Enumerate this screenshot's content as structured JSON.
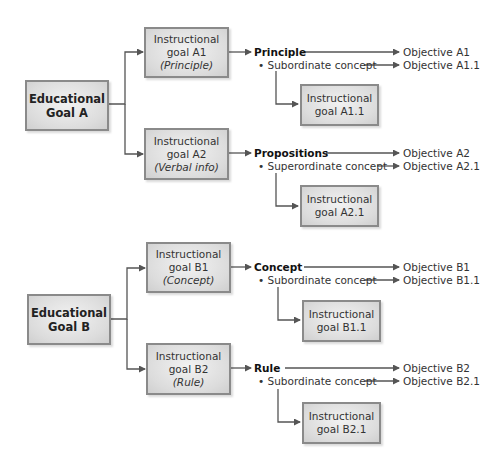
{
  "goals": [
    {
      "label_line1": "Educational",
      "label_line2": "Goal A",
      "instructional": [
        {
          "line1": "Instructional",
          "line2": "goal A1",
          "type": "(Principle)",
          "category": "Principle",
          "sub_label": "• Subordinate concept",
          "objective": "Objective A1",
          "sub_objective": "Objective A1.1",
          "sub_goal_line1": "Instructional",
          "sub_goal_line2": "goal A1.1"
        },
        {
          "line1": "Instructional",
          "line2": "goal A2",
          "type": "(Verbal info)",
          "category": "Propositions",
          "sub_label": "• Superordinate concept",
          "objective": "Objective A2",
          "sub_objective": "Objective A2.1",
          "sub_goal_line1": "Instructional",
          "sub_goal_line2": "goal A2.1"
        }
      ]
    },
    {
      "label_line1": "Educational",
      "label_line2": "Goal B",
      "instructional": [
        {
          "line1": "Instructional",
          "line2": "goal B1",
          "type": "(Concept)",
          "category": "Concept",
          "sub_label": "• Subordinate concept",
          "objective": "Objective B1",
          "sub_objective": "Objective B1.1",
          "sub_goal_line1": "Instructional",
          "sub_goal_line2": "goal B1.1"
        },
        {
          "line1": "Instructional",
          "line2": "goal B2",
          "type": "(Rule)",
          "category": "Rule",
          "sub_label": "• Subordinate concept",
          "objective": "Objective B2",
          "sub_objective": "Objective B2.1",
          "sub_goal_line1": "Instructional",
          "sub_goal_line2": "goal B2.1"
        }
      ]
    }
  ],
  "colors": {
    "line": "#555555",
    "box_border": "#8a8a8a",
    "box_fill": "#dcdcdc"
  }
}
